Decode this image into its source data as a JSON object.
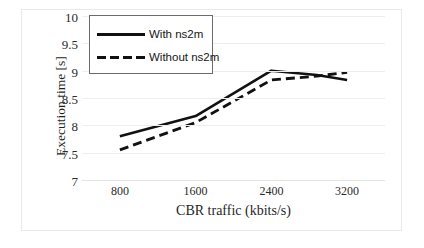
{
  "chart_data": {
    "type": "line",
    "title": "",
    "xlabel": "CBR traffic (kbits/s)",
    "ylabel": "Execution time [s]",
    "categories": [
      "800",
      "1600",
      "2400",
      "3200"
    ],
    "x": [
      800,
      1600,
      2400,
      3200
    ],
    "xlim": [
      400,
      3600
    ],
    "ylim": [
      7,
      10
    ],
    "yticks": [
      "7",
      "7.5",
      "8",
      "8.5",
      "9",
      "9.5",
      "10"
    ],
    "ytick_values": [
      7,
      7.5,
      8,
      8.5,
      9,
      9.5,
      10
    ],
    "grid": true,
    "legend_position": "top-left",
    "series": [
      {
        "name": "With ns2m",
        "style": "solid",
        "color": "#111111",
        "x": [
          800,
          1600,
          2400,
          2880,
          3200
        ],
        "values": [
          7.8,
          8.17,
          9.0,
          8.92,
          8.83
        ]
      },
      {
        "name": "Without ns2m",
        "style": "dashed",
        "color": "#111111",
        "x": [
          800,
          1600,
          2400,
          2880,
          3200
        ],
        "values": [
          7.55,
          8.05,
          8.83,
          8.9,
          8.97
        ]
      }
    ]
  },
  "legend": {
    "items": [
      {
        "label": "With ns2m",
        "style": "solid"
      },
      {
        "label": "Without ns2m",
        "style": "dashed"
      }
    ]
  },
  "axes": {
    "x_title": "CBR traffic (kbits/s)",
    "y_title": "Execution time [s]",
    "x_labels": [
      "800",
      "1600",
      "2400",
      "3200"
    ],
    "y_labels": [
      "10",
      "9.5",
      "9",
      "8.5",
      "8",
      "7.5",
      "7"
    ]
  }
}
